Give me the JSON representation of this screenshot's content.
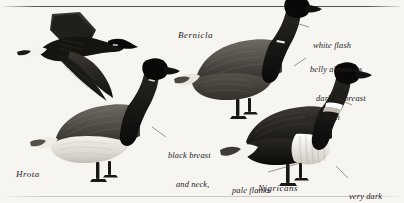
{
  "plate": {
    "kind": "field-guide-illustration",
    "subject": "Brant Goose subspecies comparison",
    "background_color": "#f6f5f1",
    "ink_color": "#24211d",
    "width": 404,
    "height": 203
  },
  "taxa": [
    {
      "id": "hrota",
      "name": "Hrota",
      "x": 16,
      "y": 176,
      "note": "pale-bellied subspecies, lower-left"
    },
    {
      "id": "bernicla",
      "name": "Bernicla",
      "x": 178,
      "y": 37,
      "note": "dark-bellied subspecies, upper-centre"
    },
    {
      "id": "nigricans",
      "name": "Nigricans",
      "x": 258,
      "y": 190,
      "note": "black brant subspecies, lower-right"
    }
  ],
  "annotations": [
    {
      "id": "white-flash",
      "lines": [
        "white flash"
      ],
      "x": 313,
      "y": 28,
      "align": "left",
      "points_to": "bernicla-neck-collar"
    },
    {
      "id": "belly-dark",
      "lines": [
        "belly almost as",
        "dark as breast"
      ],
      "x": 310,
      "y": 52,
      "align": "left",
      "points_to": "bernicla-belly"
    },
    {
      "id": "bold-flash",
      "lines": [
        "bold flash"
      ],
      "x": 305,
      "y": 99,
      "align": "left",
      "points_to": "nigricans-neck-collar"
    },
    {
      "id": "black-breast",
      "lines": [
        "black breast",
        "and neck,",
        "pale belly"
      ],
      "x": 168,
      "y": 137,
      "align": "left",
      "points_to": "hrota-breast"
    },
    {
      "id": "pale-flanks",
      "lines": [
        "pale flanks"
      ],
      "x": 232,
      "y": 172,
      "align": "left",
      "points_to": "nigricans-flank"
    },
    {
      "id": "very-dark",
      "lines": [
        "very dark"
      ],
      "x": 349,
      "y": 178,
      "align": "left",
      "points_to": "nigricans-underside"
    }
  ],
  "birds": [
    {
      "id": "flying-brant",
      "pose": "flying",
      "facing": "right",
      "region": "upper-left"
    },
    {
      "id": "hrota-bird",
      "pose": "standing",
      "facing": "right",
      "region": "lower-left-centre"
    },
    {
      "id": "bernicla-bird",
      "pose": "standing",
      "facing": "right",
      "region": "upper-right-centre"
    },
    {
      "id": "nigricans-bird",
      "pose": "standing",
      "facing": "right",
      "region": "lower-right"
    }
  ]
}
